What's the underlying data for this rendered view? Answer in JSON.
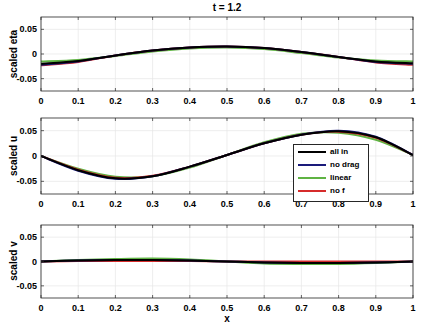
{
  "figure": {
    "title": "t = 1.2",
    "xlabel": "x"
  },
  "legend": {
    "items": [
      {
        "label": "all in",
        "color": "#000000"
      },
      {
        "label": "no drag",
        "color": "#1a1a7a"
      },
      {
        "label": "linear",
        "color": "#5fb343"
      },
      {
        "label": "no f",
        "color": "#d62b2b"
      }
    ]
  },
  "chart_data": [
    {
      "type": "line",
      "title": "t = 1.2",
      "xlabel": "",
      "ylabel": "scaled eta",
      "xlim": [
        0,
        1
      ],
      "ylim": [
        -0.075,
        0.075
      ],
      "xticks": [
        "0",
        "0.1",
        "0.2",
        "0.3",
        "0.4",
        "0.5",
        "0.6",
        "0.7",
        "0.8",
        "0.9",
        "1"
      ],
      "yticks": [
        "0.05",
        "0",
        "-0.05"
      ],
      "grid": true,
      "x": [
        0,
        0.1,
        0.2,
        0.3,
        0.4,
        0.5,
        0.6,
        0.7,
        0.8,
        0.9,
        1
      ],
      "series": [
        {
          "name": "all in",
          "values": [
            -0.02,
            -0.014,
            -0.003,
            0.007,
            0.013,
            0.015,
            0.012,
            0.004,
            -0.006,
            -0.015,
            -0.019
          ]
        },
        {
          "name": "no drag",
          "values": [
            -0.022,
            -0.015,
            -0.003,
            0.007,
            0.013,
            0.015,
            0.012,
            0.004,
            -0.006,
            -0.016,
            -0.02
          ]
        },
        {
          "name": "linear",
          "values": [
            -0.015,
            -0.012,
            -0.004,
            0.005,
            0.011,
            0.013,
            0.01,
            0.002,
            -0.007,
            -0.013,
            -0.015
          ]
        },
        {
          "name": "no f",
          "values": [
            -0.023,
            -0.016,
            -0.003,
            0.007,
            0.013,
            0.015,
            0.012,
            0.004,
            -0.006,
            -0.017,
            -0.022
          ]
        }
      ]
    },
    {
      "type": "line",
      "title": "",
      "xlabel": "",
      "ylabel": "scaled u",
      "xlim": [
        0,
        1
      ],
      "ylim": [
        -0.075,
        0.075
      ],
      "xticks": [
        "0",
        "0.1",
        "0.2",
        "0.3",
        "0.4",
        "0.5",
        "0.6",
        "0.7",
        "0.8",
        "0.9",
        "1"
      ],
      "yticks": [
        "0.05",
        "0",
        "-0.05"
      ],
      "grid": true,
      "x": [
        0,
        0.1,
        0.2,
        0.3,
        0.4,
        0.5,
        0.6,
        0.7,
        0.8,
        0.9,
        1
      ],
      "series": [
        {
          "name": "all in",
          "values": [
            0,
            -0.028,
            -0.044,
            -0.04,
            -0.021,
            0.002,
            0.025,
            0.042,
            0.049,
            0.037,
            0.002
          ]
        },
        {
          "name": "no drag",
          "values": [
            0,
            -0.029,
            -0.045,
            -0.04,
            -0.021,
            0.002,
            0.025,
            0.042,
            0.05,
            0.038,
            0.002
          ]
        },
        {
          "name": "linear",
          "values": [
            0,
            -0.025,
            -0.041,
            -0.04,
            -0.023,
            0.002,
            0.027,
            0.044,
            0.046,
            0.032,
            0.002
          ]
        },
        {
          "name": "no f",
          "values": [
            0,
            -0.027,
            -0.043,
            -0.039,
            -0.021,
            0.002,
            0.025,
            0.042,
            0.048,
            0.036,
            0.002
          ]
        }
      ],
      "legend_position": "inside right"
    },
    {
      "type": "line",
      "title": "",
      "xlabel": "x",
      "ylabel": "scaled v",
      "xlim": [
        0,
        1
      ],
      "ylim": [
        -0.075,
        0.075
      ],
      "xticks": [
        "0",
        "0.1",
        "0.2",
        "0.3",
        "0.4",
        "0.5",
        "0.6",
        "0.7",
        "0.8",
        "0.9",
        "1"
      ],
      "yticks": [
        "0.05",
        "0",
        "-0.05"
      ],
      "grid": true,
      "x": [
        0,
        0.1,
        0.2,
        0.3,
        0.4,
        0.5,
        0.6,
        0.7,
        0.8,
        0.9,
        1
      ],
      "series": [
        {
          "name": "all in",
          "values": [
            0,
            0.002,
            0.003,
            0.003,
            0.002,
            0,
            -0.002,
            -0.003,
            -0.003,
            -0.002,
            0
          ]
        },
        {
          "name": "no drag",
          "values": [
            0,
            0.002,
            0.003,
            0.003,
            0.002,
            0,
            -0.002,
            -0.003,
            -0.003,
            -0.002,
            0
          ]
        },
        {
          "name": "linear",
          "values": [
            0,
            0.003,
            0.005,
            0.006,
            0.004,
            0,
            -0.004,
            -0.005,
            -0.005,
            -0.003,
            0
          ]
        },
        {
          "name": "no f",
          "values": [
            0,
            0.001,
            0.001,
            0.001,
            0.001,
            0,
            0,
            0,
            0,
            0,
            0
          ]
        }
      ]
    }
  ]
}
